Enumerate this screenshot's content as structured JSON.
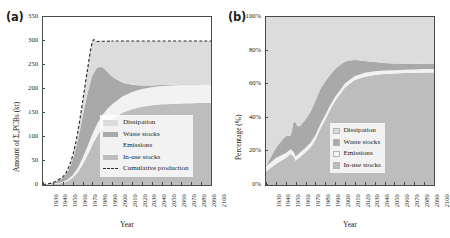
{
  "figure": {
    "panels": [
      {
        "id": "a",
        "label": "(a)",
        "ylabel": "Amount of Σ₆PCBs (kt)",
        "xlabel": "Year"
      },
      {
        "id": "b",
        "label": "(b)",
        "ylabel": "Percentage (%)",
        "xlabel": "Year"
      }
    ]
  },
  "colors": {
    "dissipation": "#dcdcdc",
    "waste_stocks": "#a9a9a9",
    "emissions": "#f2f2f2",
    "in_use_stocks": "#bdbdbd",
    "cumulative_production": "#2b2b2b",
    "axis": "#4a4a4a",
    "text": "#231f20",
    "background": "#ffffff"
  },
  "legend_a": {
    "items": [
      {
        "label": "Dissipation",
        "marker": "swatch",
        "color": "#dcdcdc"
      },
      {
        "label": "Waste stocks",
        "marker": "swatch",
        "color": "#a9a9a9"
      },
      {
        "label": "Emissions",
        "marker": "swatch",
        "color": "#f2f2f2"
      },
      {
        "label": "In-use stocks",
        "marker": "swatch",
        "color": "#bdbdbd"
      },
      {
        "label": "Cumulative production",
        "marker": "dashed-line",
        "color": "#2b2b2b"
      }
    ]
  },
  "legend_b": {
    "items": [
      {
        "label": "Dissipation",
        "marker": "square",
        "color": "#dcdcdc"
      },
      {
        "label": "Waste stocks",
        "marker": "square",
        "color": "#a9a9a9"
      },
      {
        "label": "Emissions",
        "marker": "square",
        "color": "#f2f2f2"
      },
      {
        "label": "In-use stocks",
        "marker": "square",
        "color": "#bdbdbd"
      }
    ]
  },
  "chart_data": [
    {
      "type": "area",
      "panel": "a",
      "title": "",
      "xlabel": "Year",
      "ylabel": "Amount of Σ₆PCBs (kt)",
      "xlim": [
        1930,
        2100
      ],
      "ylim": [
        0,
        350
      ],
      "yticks": [
        0,
        50,
        100,
        150,
        200,
        250,
        300,
        350
      ],
      "xticks": [
        1930,
        1940,
        1950,
        1960,
        1970,
        1980,
        1990,
        2000,
        2010,
        2020,
        2030,
        2040,
        2050,
        2060,
        2070,
        2080,
        2090,
        2100
      ],
      "grid": false,
      "legend_position": "center-right",
      "stacked": true,
      "x": [
        1930,
        1940,
        1950,
        1955,
        1960,
        1965,
        1970,
        1975,
        1980,
        1985,
        1990,
        1995,
        2000,
        2010,
        2020,
        2030,
        2040,
        2050,
        2060,
        2070,
        2080,
        2090,
        2100
      ],
      "series": [
        {
          "name": "In-use stocks",
          "values": [
            0.3,
            1.4,
            4.5,
            8.5,
            15.0,
            26.0,
            42.0,
            62.0,
            84.0,
            103.0,
            118.0,
            129.0,
            137.0,
            150.0,
            158.0,
            163.0,
            166.0,
            168.0,
            169.0,
            170.0,
            170.5,
            171.0,
            171.0
          ]
        },
        {
          "name": "Emissions",
          "values": [
            0.1,
            0.5,
            1.6,
            3.0,
            5.4,
            9.0,
            13.5,
            18.0,
            22.0,
            25.0,
            27.5,
            29.5,
            31.0,
            34.0,
            36.0,
            37.0,
            37.5,
            38.0,
            38.3,
            38.5,
            38.6,
            38.8,
            39.0
          ]
        },
        {
          "name": "Waste stocks",
          "values": [
            0.5,
            2.6,
            8.9,
            17.0,
            32.0,
            56.0,
            86.0,
            110.0,
            122.0,
            117.0,
            100.0,
            78.0,
            58.0,
            30.0,
            15.0,
            7.5,
            4.0,
            2.2,
            1.4,
            1.0,
            0.8,
            0.6,
            0.5
          ]
        },
        {
          "name": "Dissipation",
          "values": [
            0.1,
            0.5,
            1.9,
            4.0,
            8.6,
            17.0,
            31.0,
            50.0,
            70.0,
            54.0,
            54.0,
            63.0,
            74.0,
            86.0,
            91.0,
            92.5,
            92.5,
            91.8,
            91.3,
            90.5,
            90.1,
            89.6,
            89.5
          ]
        }
      ],
      "reference_line": {
        "name": "Cumulative production",
        "style": "dashed",
        "x": [
          1930,
          1940,
          1950,
          1955,
          1960,
          1965,
          1970,
          1975,
          1980,
          1985,
          1990,
          1995,
          2000,
          2010,
          2100
        ],
        "values": [
          1.0,
          5.0,
          17.0,
          32.5,
          61.0,
          108.0,
          172.5,
          240.0,
          298.0,
          299.0,
          299.5,
          299.5,
          300.0,
          300.0,
          300.0
        ]
      },
      "plateau_total_kt": 300,
      "plateau_in_use_plus_emissions_kt": 210
    },
    {
      "type": "area",
      "panel": "b",
      "title": "",
      "xlabel": "Year",
      "ylabel": "Percentage (%)",
      "xlim": [
        1930,
        2100
      ],
      "ylim": [
        0,
        100
      ],
      "yticks": [
        0,
        20,
        40,
        60,
        80,
        100
      ],
      "ytick_labels": [
        "0%",
        "20%",
        "40%",
        "60%",
        "80%",
        "100%"
      ],
      "xticks": [
        1930,
        1940,
        1950,
        1960,
        1970,
        1980,
        1990,
        2000,
        2010,
        2020,
        2030,
        2040,
        2050,
        2060,
        2070,
        2080,
        2090,
        2100
      ],
      "grid": false,
      "legend_position": "lower-right",
      "stacked": true,
      "normalized": true,
      "x": [
        1930,
        1940,
        1950,
        1955,
        1958,
        1960,
        1962,
        1965,
        1970,
        1975,
        1980,
        1985,
        1990,
        1995,
        2000,
        2010,
        2020,
        2030,
        2040,
        2050,
        2060,
        2070,
        2080,
        2090,
        2100
      ],
      "series": [
        {
          "name": "In-use stocks",
          "values": [
            8.0,
            12.5,
            16.0,
            18.5,
            17.0,
            14.5,
            15.5,
            17.0,
            19.5,
            22.5,
            27.0,
            33.5,
            39.0,
            45.0,
            50.0,
            58.0,
            62.5,
            64.5,
            65.5,
            66.0,
            66.3,
            66.6,
            66.8,
            67.0,
            67.0
          ]
        },
        {
          "name": "Emissions",
          "values": [
            3.0,
            3.5,
            3.0,
            2.8,
            2.6,
            2.5,
            2.5,
            2.6,
            2.6,
            2.6,
            2.6,
            2.6,
            2.6,
            2.6,
            2.6,
            2.5,
            2.4,
            2.3,
            2.2,
            2.1,
            2.0,
            2.0,
            2.0,
            2.0,
            2.0
          ]
        },
        {
          "name": "Waste stocks",
          "values": [
            0.0,
            6.0,
            10.0,
            8.5,
            18.0,
            20.0,
            17.0,
            16.0,
            17.0,
            18.5,
            20.5,
            21.0,
            20.0,
            18.0,
            16.5,
            13.0,
            9.5,
            7.0,
            5.5,
            4.5,
            4.0,
            3.6,
            3.3,
            3.1,
            3.0
          ]
        },
        {
          "name": "Dissipation",
          "values": [
            89.0,
            78.0,
            71.0,
            70.2,
            62.4,
            63.0,
            65.0,
            64.4,
            60.9,
            56.4,
            49.9,
            42.9,
            38.4,
            34.4,
            30.9,
            26.5,
            25.6,
            26.2,
            26.8,
            27.4,
            27.7,
            27.8,
            27.9,
            27.9,
            28.0
          ]
        }
      ]
    }
  ]
}
